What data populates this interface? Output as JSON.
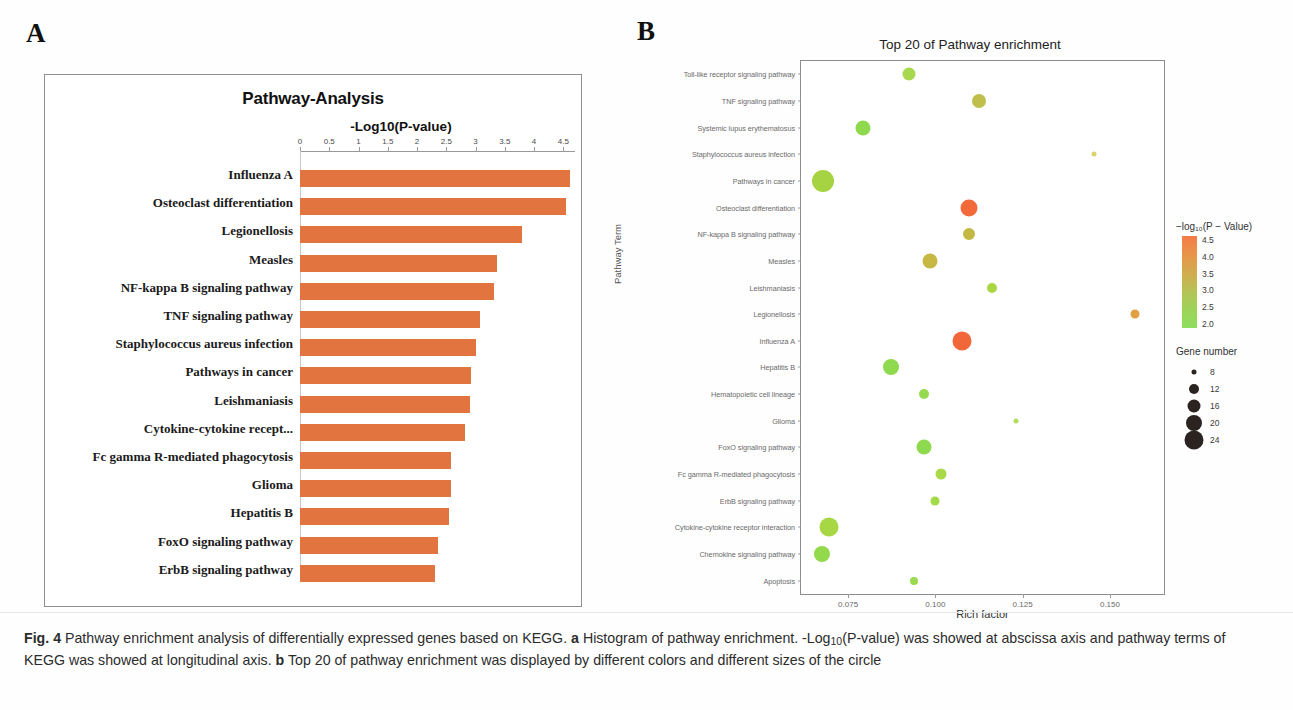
{
  "panels": {
    "a_letter": "A",
    "b_letter": "B"
  },
  "panelA": {
    "title": "Pathway-Analysis",
    "axis_title": "-Log10(P-value)",
    "x_ticks": [
      "0",
      "0.5",
      "1",
      "1.5",
      "2",
      "2.5",
      "3",
      "3.5",
      "4",
      "4.5"
    ],
    "chart_data": {
      "type": "bar",
      "title": "Pathway-Analysis",
      "xlabel": "-Log10(P-value)",
      "ylabel": "",
      "orientation": "horizontal",
      "xlim": [
        0,
        4.7
      ],
      "grid": false,
      "bar_color": "#e2753f",
      "categories": [
        "Influenza A",
        "Osteoclast differentiation",
        "Legionellosis",
        "Measles",
        "NF-kappa B signaling pathway",
        "TNF signaling pathway",
        "Staphylococcus aureus infection",
        "Pathways in cancer",
        "Leishmaniasis",
        "Cytokine-cytokine recept...",
        "Fc gamma R-mediated phagocytosis",
        "Glioma",
        "Hepatitis B",
        "FoxO signaling pathway",
        "ErbB signaling pathway"
      ],
      "values": [
        4.62,
        4.55,
        3.8,
        3.37,
        3.32,
        3.08,
        3.0,
        2.93,
        2.9,
        2.82,
        2.58,
        2.58,
        2.55,
        2.35,
        2.3
      ]
    }
  },
  "panelB": {
    "title": "Top 20 of Pathway enrichment",
    "xlabel": "Rich factor",
    "ylabel": "Pathway Term",
    "x_ticks": [
      "0.075",
      "0.100",
      "0.125",
      "0.150"
    ],
    "x_tick_values": [
      0.075,
      0.1,
      0.125,
      0.15
    ],
    "color_legend": {
      "title": "−log₁₀(P − Value)",
      "ticks": [
        "4.5",
        "4.0",
        "3.5",
        "3.0",
        "2.5",
        "2.0"
      ],
      "high_color": "#f47b48",
      "low_color": "#8ede5e"
    },
    "size_legend": {
      "title": "Gene number",
      "items": [
        "8",
        "12",
        "16",
        "20",
        "24"
      ],
      "sizes_px": [
        2.5,
        5,
        6.5,
        8,
        9.5
      ]
    },
    "chart_data": {
      "type": "scatter",
      "title": "Top 20 of Pathway enrichment",
      "xlabel": "Rich factor",
      "ylabel": "Pathway Term",
      "xlim": [
        0.0615,
        0.1655
      ],
      "grid": false,
      "legend_position": "right",
      "color_scale_label": "−log₁₀(P − Value)",
      "size_scale_label": "Gene number",
      "points": [
        {
          "term": "Toll-like receptor signaling pathway",
          "rich_factor": 0.0924,
          "neg_log10_p": 2.55,
          "gene_number": 11,
          "color": "#a8d84e",
          "size_px": 6.5
        },
        {
          "term": "TNF signaling pathway",
          "rich_factor": 0.1126,
          "neg_log10_p": 3.08,
          "gene_number": 13,
          "color": "#c0bf4b",
          "size_px": 7
        },
        {
          "term": "Systemic lupus erythematosus",
          "rich_factor": 0.0792,
          "neg_log10_p": 2.4,
          "gene_number": 13,
          "color": "#8fd94f",
          "size_px": 7.5
        },
        {
          "term": "Staphylococcus aureus infection",
          "rich_factor": 0.1455,
          "neg_log10_p": 3.0,
          "gene_number": 7,
          "color": "#d8d468",
          "size_px": 2.5
        },
        {
          "term": "Pathways in cancer",
          "rich_factor": 0.0678,
          "neg_log10_p": 2.93,
          "gene_number": 24,
          "color": "#a5d342",
          "size_px": 11
        },
        {
          "term": "Osteoclast differentiation",
          "rich_factor": 0.1096,
          "neg_log10_p": 4.55,
          "gene_number": 17,
          "color": "#f2693a",
          "size_px": 8.5
        },
        {
          "term": "NF-kappa B signaling pathway",
          "rich_factor": 0.1096,
          "neg_log10_p": 3.32,
          "gene_number": 12,
          "color": "#c4b845",
          "size_px": 6
        },
        {
          "term": "Measles",
          "rich_factor": 0.0985,
          "neg_log10_p": 3.37,
          "gene_number": 15,
          "color": "#c6b842",
          "size_px": 7.5
        },
        {
          "term": "Leishmaniasis",
          "rich_factor": 0.1163,
          "neg_log10_p": 2.9,
          "gene_number": 10,
          "color": "#aad644",
          "size_px": 5
        },
        {
          "term": "Legionellosis",
          "rich_factor": 0.1573,
          "neg_log10_p": 3.8,
          "gene_number": 9,
          "color": "#e0a044",
          "size_px": 4.5
        },
        {
          "term": "Influenza A",
          "rich_factor": 0.1076,
          "neg_log10_p": 4.62,
          "gene_number": 20,
          "color": "#f2673a",
          "size_px": 9.5
        },
        {
          "term": "Hepatitis B",
          "rich_factor": 0.0874,
          "neg_log10_p": 2.55,
          "gene_number": 16,
          "color": "#8ed94d",
          "size_px": 8
        },
        {
          "term": "Hematopoietic cell lineage",
          "rich_factor": 0.0966,
          "neg_log10_p": 2.3,
          "gene_number": 10,
          "color": "#97d94f",
          "size_px": 5
        },
        {
          "term": "Glioma",
          "rich_factor": 0.1232,
          "neg_log10_p": 2.58,
          "gene_number": 6,
          "color": "#b5dd5c",
          "size_px": 2.5
        },
        {
          "term": "FoxO signaling pathway",
          "rich_factor": 0.0966,
          "neg_log10_p": 2.35,
          "gene_number": 15,
          "color": "#8ed94d",
          "size_px": 7.5
        },
        {
          "term": "Fc gamma R-mediated phagocytosis",
          "rich_factor": 0.1016,
          "neg_log10_p": 2.58,
          "gene_number": 11,
          "color": "#a9d948",
          "size_px": 5.5
        },
        {
          "term": "ErbB signaling pathway",
          "rich_factor": 0.0999,
          "neg_log10_p": 2.3,
          "gene_number": 9,
          "color": "#a3da48",
          "size_px": 4.5
        },
        {
          "term": "Cytokine-cytokine receptor interaction",
          "rich_factor": 0.0696,
          "neg_log10_p": 2.82,
          "gene_number": 21,
          "color": "#a7d844",
          "size_px": 9.5
        },
        {
          "term": "Chemokine signaling pathway",
          "rich_factor": 0.0675,
          "neg_log10_p": 2.5,
          "gene_number": 18,
          "color": "#93d94c",
          "size_px": 8
        },
        {
          "term": "Apoptosis",
          "rich_factor": 0.0939,
          "neg_log10_p": 2.2,
          "gene_number": 8,
          "color": "#9ada4f",
          "size_px": 4
        }
      ]
    }
  },
  "caption": {
    "fig_label": "Fig. 4",
    "text_1": " Pathway enrichment analysis of differentially expressed genes based on KEGG. ",
    "a_label": "a",
    "text_2": " Histogram of pathway enrichment. -Log",
    "sub_10": "10",
    "text_3": "(P-value) was showed at abscissa axis and pathway terms of KEGG was showed at longitudinal axis. ",
    "b_label": "b",
    "text_4": " Top 20 of pathway enrichment was displayed by different colors and different sizes of the circle"
  }
}
